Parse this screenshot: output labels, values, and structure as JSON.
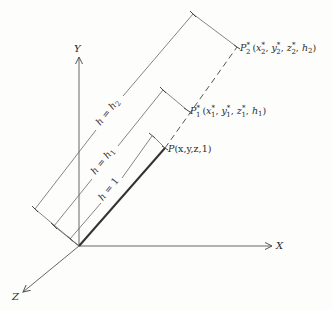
{
  "diagram": {
    "type": "3D homogeneous coordinate projection",
    "axes": {
      "x": {
        "label": "X"
      },
      "y": {
        "label": "Y"
      },
      "z": {
        "label": "Z"
      }
    },
    "points": [
      {
        "id": "P",
        "name": "P",
        "sup": "",
        "sub": "",
        "coords": "(x,y,z,1)"
      },
      {
        "id": "P1",
        "name": "P",
        "sup": "*",
        "sub": "1",
        "coords": "(x*1, y*1, z*1, h1)",
        "parts": [
          "(x",
          "*",
          "1",
          ", y",
          "*",
          "1",
          ", z",
          "*",
          "1",
          ", h",
          "1",
          ")"
        ]
      },
      {
        "id": "P2",
        "name": "P",
        "sup": "*",
        "sub": "2",
        "coords": "(x*2, y*2, z*2, h2)",
        "parts": [
          "(x",
          "*",
          "2",
          ", y",
          "*",
          "2",
          ", z",
          "*",
          "2",
          ", h",
          "2",
          ")"
        ]
      }
    ],
    "dimensions": [
      {
        "id": "h1-unit",
        "label": "h = 1"
      },
      {
        "id": "h-h1",
        "label": "h = h",
        "sub": "1"
      },
      {
        "id": "h-h2",
        "label": "h = h",
        "sub": "2"
      }
    ],
    "colors": {
      "line": "#555555",
      "text": "#2a2a2a",
      "background": "#fdfdfb"
    }
  }
}
